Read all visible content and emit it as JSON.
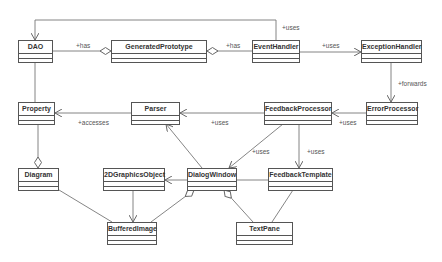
{
  "diagram": {
    "type": "UML class diagram",
    "classes": [
      {
        "id": "dao",
        "name": "DAO",
        "x": 18,
        "y": 40,
        "w": 35
      },
      {
        "id": "generated-prototype",
        "name": "GeneratedPrototype",
        "x": 111,
        "y": 40,
        "w": 96
      },
      {
        "id": "event-handler",
        "name": "EventHandler",
        "x": 252,
        "y": 40,
        "w": 48
      },
      {
        "id": "exception-handler",
        "name": "ExceptionHandler",
        "x": 361,
        "y": 40,
        "w": 61
      },
      {
        "id": "property",
        "name": "Property",
        "x": 18,
        "y": 102,
        "w": 37
      },
      {
        "id": "parser",
        "name": "Parser",
        "x": 131,
        "y": 102,
        "w": 49
      },
      {
        "id": "feedback-processor",
        "name": "FeedbackProcessor",
        "x": 264,
        "y": 102,
        "w": 68
      },
      {
        "id": "error-processor",
        "name": "ErrorProcessor",
        "x": 366,
        "y": 102,
        "w": 52
      },
      {
        "id": "diagram",
        "name": "Diagram",
        "x": 18,
        "y": 168,
        "w": 41
      },
      {
        "id": "2d-graphics-object",
        "name": "2DGraphicsObject",
        "x": 103,
        "y": 168,
        "w": 62
      },
      {
        "id": "dialog-window",
        "name": "DialogWindow",
        "x": 187,
        "y": 168,
        "w": 50
      },
      {
        "id": "feedback-template",
        "name": "FeedbackTemplate",
        "x": 268,
        "y": 168,
        "w": 65
      },
      {
        "id": "buffered-image",
        "name": "BufferedImage",
        "x": 107,
        "y": 222,
        "w": 50
      },
      {
        "id": "text-pane",
        "name": "TextPane",
        "x": 236,
        "y": 222,
        "w": 57
      }
    ],
    "relations": [
      {
        "from": "DAO",
        "to": "GeneratedPrototype",
        "kind": "aggregation",
        "label": "+has"
      },
      {
        "from": "GeneratedPrototype",
        "to": "EventHandler",
        "kind": "aggregation",
        "label": "+has"
      },
      {
        "from": "EventHandler",
        "to": "DAO",
        "kind": "dependency",
        "label": "+uses"
      },
      {
        "from": "EventHandler",
        "to": "ExceptionHandler",
        "kind": "dependency",
        "label": "+uses"
      },
      {
        "from": "ExceptionHandler",
        "to": "ErrorProcessor",
        "kind": "dependency",
        "label": "+forwards"
      },
      {
        "from": "ErrorProcessor",
        "to": "FeedbackProcessor",
        "kind": "dependency",
        "label": "+uses"
      },
      {
        "from": "FeedbackProcessor",
        "to": "Parser",
        "kind": "dependency",
        "label": "+uses"
      },
      {
        "from": "Parser",
        "to": "Property",
        "kind": "dependency",
        "label": "+accesses"
      },
      {
        "from": "FeedbackProcessor",
        "to": "DialogWindow",
        "kind": "dependency",
        "label": "+uses"
      },
      {
        "from": "FeedbackProcessor",
        "to": "FeedbackTemplate",
        "kind": "dependency",
        "label": "+uses"
      },
      {
        "from": "DAO",
        "to": "Property",
        "kind": "association",
        "label": ""
      },
      {
        "from": "Property",
        "to": "Diagram",
        "kind": "aggregation",
        "label": ""
      },
      {
        "from": "DialogWindow",
        "to": "Parser",
        "kind": "dependency",
        "label": ""
      },
      {
        "from": "DialogWindow",
        "to": "2DGraphicsObject",
        "kind": "dependency",
        "label": ""
      },
      {
        "from": "DialogWindow",
        "to": "FeedbackTemplate",
        "kind": "association",
        "label": ""
      },
      {
        "from": "2DGraphicsObject",
        "to": "BufferedImage",
        "kind": "dependency",
        "label": ""
      },
      {
        "from": "Diagram",
        "to": "BufferedImage",
        "kind": "association",
        "label": ""
      },
      {
        "from": "DialogWindow",
        "to": "BufferedImage",
        "kind": "aggregation",
        "label": ""
      },
      {
        "from": "DialogWindow",
        "to": "TextPane",
        "kind": "aggregation",
        "label": ""
      },
      {
        "from": "FeedbackTemplate",
        "to": "TextPane",
        "kind": "association",
        "label": ""
      }
    ]
  },
  "labels": {
    "dao_has": "+has",
    "gp_has": "+has",
    "eh_uses_dao": "+uses",
    "eh_uses_ex": "+uses",
    "forwards": "+forwards",
    "ep_uses": "+uses",
    "fp_uses_parser": "+uses",
    "accesses": "+accesses",
    "fp_uses_dw": "+uses",
    "fp_uses_ft": "+uses"
  },
  "names": {
    "dao": "DAO",
    "generated_prototype": "GeneratedPrototype",
    "event_handler": "EventHandler",
    "exception_handler": "ExceptionHandler",
    "property": "Property",
    "parser": "Parser",
    "feedback_processor": "FeedbackProcessor",
    "error_processor": "ErrorProcessor",
    "diagram": "Diagram",
    "graphics_object": "2DGraphicsObject",
    "dialog_window": "DialogWindow",
    "feedback_template": "FeedbackTemplate",
    "buffered_image": "BufferedImage",
    "text_pane": "TextPane"
  },
  "colors": {
    "line": "#666666",
    "border": "#555555",
    "text": "#333333",
    "background": "#ffffff"
  }
}
